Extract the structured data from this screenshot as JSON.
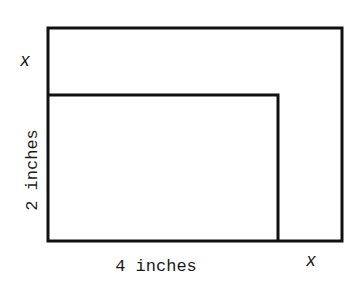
{
  "diagram": {
    "type": "nested-rectangles",
    "stroke_color": "#111111",
    "outer_rectangle": {
      "x": 48,
      "y": 28,
      "width": 294,
      "height": 213
    },
    "inner_rectangle": {
      "x": 48,
      "y": 95,
      "width": 230,
      "height": 146
    },
    "labels": {
      "left_top_x": "x",
      "left_side": "2 inches",
      "bottom_side": "4 inches",
      "bottom_right_x": "x"
    }
  }
}
